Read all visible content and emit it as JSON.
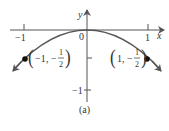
{
  "figure": {
    "caption": "(a)",
    "axes": {
      "x_label": "x",
      "y_label": "y",
      "origin_label": "0",
      "x_ticks": [
        "−1",
        "1"
      ],
      "y_ticks": [
        "−1"
      ]
    },
    "points": [
      {
        "label_x": "−1",
        "label_sep": ", −",
        "num": "1",
        "den": "2"
      },
      {
        "label_x": "1",
        "label_sep": ", −",
        "num": "1",
        "den": "2"
      }
    ],
    "curve_color": "#555555",
    "axis_color": "#555555"
  }
}
